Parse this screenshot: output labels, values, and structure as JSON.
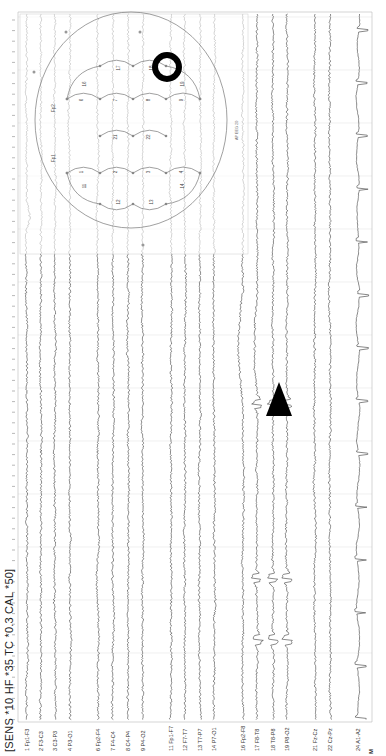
{
  "header": {
    "settings_text": "[SENS *10  HF *35  TC *0.3  CAL *50]"
  },
  "layout": {
    "orientation": "rotated-90-ccw",
    "time_gridlines_y": [
      17,
      70,
      123,
      176,
      229,
      282,
      335,
      388,
      441,
      494,
      547,
      600,
      653
    ],
    "label_baseline_y": 736
  },
  "channels": [
    {
      "num": "1",
      "name": "Fp1-F3",
      "x": 27
    },
    {
      "num": "2",
      "name": "F3-C3",
      "x": 41
    },
    {
      "num": "3",
      "name": "C3-P3",
      "x": 55
    },
    {
      "num": "4",
      "name": "P3-O1",
      "x": 70
    },
    {
      "num": "6",
      "name": "Fp2-F4",
      "x": 98
    },
    {
      "num": "7",
      "name": "F4-C4",
      "x": 113
    },
    {
      "num": "8",
      "name": "C4-P4",
      "x": 128
    },
    {
      "num": "9",
      "name": "P4-O2",
      "x": 143
    },
    {
      "num": "11",
      "name": "Fp1-F7",
      "x": 171
    },
    {
      "num": "12",
      "name": "F7-T7",
      "x": 185
    },
    {
      "num": "13",
      "name": "T7-P7",
      "x": 200
    },
    {
      "num": "14",
      "name": "P7-O1",
      "x": 214
    },
    {
      "num": "16",
      "name": "Fp2-F8",
      "x": 243
    },
    {
      "num": "17",
      "name": "F8-T8",
      "x": 257
    },
    {
      "num": "18",
      "name": "T8-P8",
      "x": 273
    },
    {
      "num": "19",
      "name": "P8-O2",
      "x": 287
    },
    {
      "num": "21",
      "name": "Fz-Cz",
      "x": 315
    },
    {
      "num": "22",
      "name": "Cz-Pz",
      "x": 330
    },
    {
      "num": "24",
      "name": "A1-A2",
      "x": 358
    }
  ],
  "footer_marker": "M",
  "head_map": {
    "title": "Bipolar montage map",
    "electrodes_labels": [
      "Fp1",
      "Fp2",
      "F7",
      "F8"
    ],
    "segment_numbers": [
      "1",
      "2",
      "3",
      "4",
      "6",
      "7",
      "8",
      "9",
      "11",
      "12",
      "13",
      "14",
      "16",
      "17",
      "18",
      "19",
      "21",
      "22"
    ],
    "corner_label": "AP EEG 20",
    "highlighted_segment": "18"
  },
  "annotations": {
    "arrowhead": {
      "x": 279,
      "y": 402,
      "color": "#000000"
    },
    "circle": {
      "cx": 167,
      "cy": 67,
      "r": 12,
      "color": "#000000"
    }
  },
  "colors": {
    "trace": "#2a2a2a",
    "trace_faint": "#9a9a9a",
    "grid": "#e6e6e6",
    "ecg": "#555555",
    "map_line": "#777777"
  }
}
